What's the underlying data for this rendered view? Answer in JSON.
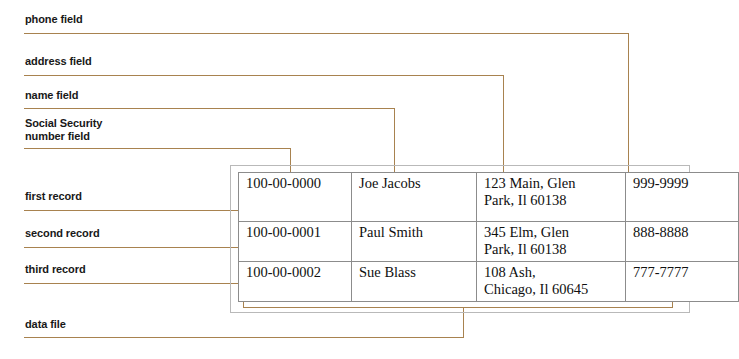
{
  "diagram": {
    "line_color": "#a8824f",
    "table_border_color": "#8c8c8c",
    "file_box_border_color": "#b9b9b9"
  },
  "callouts": {
    "phone_field": "phone field",
    "address_field": "address field",
    "name_field": "name field",
    "ssn_field_line1": "Social Security",
    "ssn_field_line2": "number field",
    "first_record": "first record",
    "second_record": "second record",
    "third_record": "third record",
    "data_file": "data file"
  },
  "table": {
    "columns": [
      "ssn",
      "name",
      "address",
      "phone"
    ],
    "rows": [
      {
        "ssn": "100-00-0000",
        "name": "Joe Jacobs",
        "address": "123 Main, Glen\nPark, Il 60138",
        "phone": "999-9999"
      },
      {
        "ssn": "100-00-0001",
        "name": "Paul Smith",
        "address": "345 Elm, Glen\nPark, Il 60138",
        "phone": "888-8888"
      },
      {
        "ssn": "100-00-0002",
        "name": "Sue Blass",
        "address": "108 Ash,\nChicago, Il 60645",
        "phone": "777-7777"
      }
    ]
  }
}
